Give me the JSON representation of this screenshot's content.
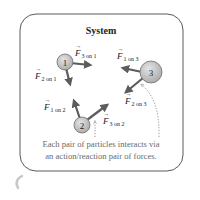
{
  "diagram": {
    "title": "System",
    "particles": [
      {
        "id": "1",
        "label": "1"
      },
      {
        "id": "2",
        "label": "2"
      },
      {
        "id": "3",
        "label": "3"
      }
    ],
    "forces": [
      {
        "symbol": "F",
        "sub": "3 on 1"
      },
      {
        "symbol": "F",
        "sub": "2 on 1"
      },
      {
        "symbol": "F",
        "sub": "1 on 3"
      },
      {
        "symbol": "F",
        "sub": "2 on 3"
      },
      {
        "symbol": "F",
        "sub": "1 on 2"
      },
      {
        "symbol": "F",
        "sub": "3 on 2"
      }
    ],
    "caption": {
      "line1": "Each pair of particles interacts via",
      "line2": "an action/reaction pair of forces."
    },
    "colors": {
      "border": "#5a5a5a",
      "particle_fill": "#bdbdbd",
      "particle_stroke": "#6e6e6e",
      "arrow": "#5c5c5c",
      "caption": "#6a6a6a"
    }
  }
}
